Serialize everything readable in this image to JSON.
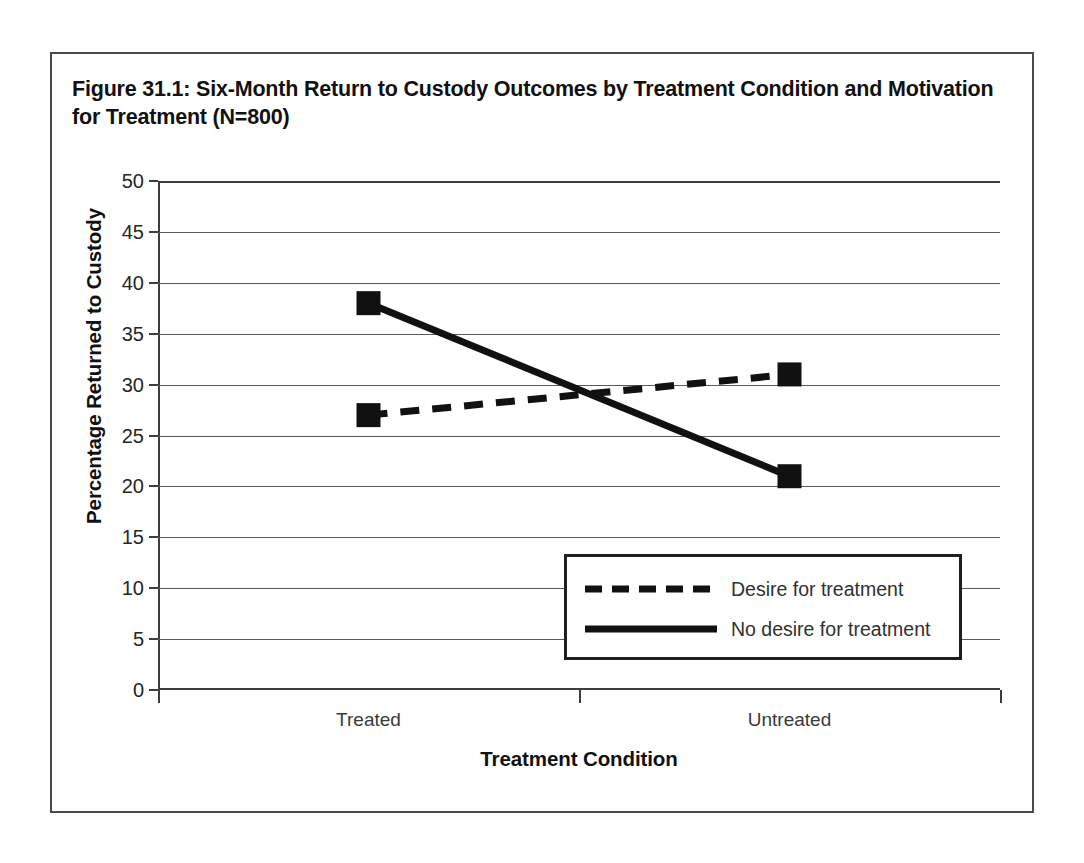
{
  "figure": {
    "title": "Figure 31.1: Six-Month Return to Custody Outcomes by Treatment Condition and Motivation for Treatment (N=800)",
    "border_color": "#4a4a4a",
    "background": "#ffffff"
  },
  "chart_data": {
    "type": "line",
    "title": "Figure 31.1: Six-Month Return to Custody Outcomes by Treatment Condition and Motivation for Treatment (N=800)",
    "xlabel": "Treatment Condition",
    "ylabel": "Percentage Returned to Custody",
    "categories": [
      "Treated",
      "Untreated"
    ],
    "ylim": [
      0,
      50
    ],
    "yticks": [
      0,
      5,
      10,
      15,
      20,
      25,
      30,
      35,
      40,
      45,
      50
    ],
    "ytick_labels": [
      "0",
      "5",
      "10",
      "15",
      "20",
      "25",
      "30",
      "35",
      "40",
      "45",
      "50"
    ],
    "grid": true,
    "grid_axis": "y",
    "legend_position": "lower right",
    "series": [
      {
        "name": "Desire for treatment",
        "values": [
          27,
          31
        ],
        "style": "dashed",
        "marker": "square",
        "color": "#111111"
      },
      {
        "name": "No desire for treatment",
        "values": [
          38,
          21
        ],
        "style": "solid",
        "marker": "square",
        "color": "#111111"
      }
    ]
  },
  "legend": {
    "entries": [
      {
        "label": "Desire for treatment",
        "style": "dashed"
      },
      {
        "label": "No desire for treatment",
        "style": "solid"
      }
    ]
  }
}
